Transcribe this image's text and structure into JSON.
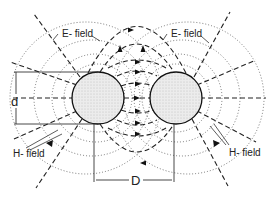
{
  "diagram": {
    "labels": {
      "e_field_left": "E- field",
      "e_field_right": "E- field",
      "h_field_left": "H- field",
      "h_field_right": "H- field",
      "conductor_diameter": "d",
      "conductor_spacing": "D"
    },
    "conductors": [
      {
        "name": "left-conductor",
        "cx": 98,
        "cy": 98,
        "r": 26
      },
      {
        "name": "right-conductor",
        "cx": 176,
        "cy": 98,
        "r": 26
      }
    ],
    "colors": {
      "line": "#222222",
      "conductor_fill": "#e6e6e6",
      "background": "#ffffff"
    },
    "legend": {
      "dashed": "E-field lines",
      "dotted": "H-field lines"
    }
  }
}
